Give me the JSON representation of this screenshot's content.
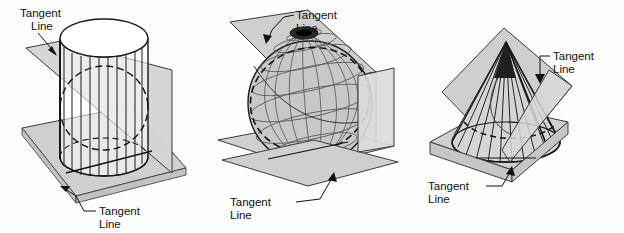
{
  "figure": {
    "title_visible": false,
    "background_color": "#fdfdfd",
    "panel_count": 3
  },
  "style": {
    "plane_fill": "#cfcfcf",
    "plane_fill_light": "#dcdcdc",
    "plane_stroke": "#3a3a3a",
    "surface_stroke": "#1a1a1a",
    "mesh_stroke": "#5a5a5a",
    "hidden_stroke": "#111111",
    "label_color": "#111111",
    "leader_color": "#111111",
    "sphere_fill": "#c8c8c8",
    "cone_fill": "#d5d5d5",
    "cylinder_fill": "#ffffff"
  },
  "panels": [
    {
      "id": "cylinder",
      "shape_name": "cylinder",
      "labels": [
        {
          "id": "cyl-label-top",
          "line1": "Tangent",
          "line2": "Line"
        },
        {
          "id": "cyl-label-bottom",
          "line1": "Tangent",
          "line2": "Line"
        }
      ]
    },
    {
      "id": "sphere",
      "shape_name": "sphere",
      "labels": [
        {
          "id": "sph-label-top",
          "line1": "Tangent",
          "line2": "Line"
        },
        {
          "id": "sph-label-bottom",
          "line1": "Tangent",
          "line2": "Line"
        }
      ]
    },
    {
      "id": "cone",
      "shape_name": "cone",
      "labels": [
        {
          "id": "cone-label-top",
          "line1": "Tangent",
          "line2": "Line"
        },
        {
          "id": "cone-label-bottom",
          "line1": "Tangent",
          "line2": "Line"
        }
      ]
    }
  ]
}
